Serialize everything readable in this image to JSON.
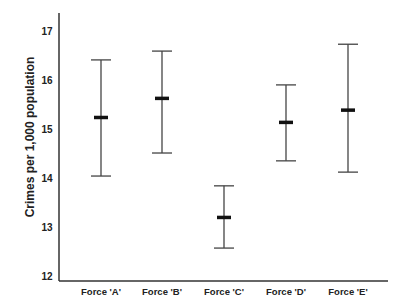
{
  "chart_data": {
    "type": "errorbar",
    "title": "",
    "xlabel": "",
    "ylabel": "Crimes per 1,000 population",
    "ylim": [
      12,
      17
    ],
    "yticks": [
      12,
      13,
      14,
      15,
      16,
      17
    ],
    "grid": false,
    "legend": null,
    "categories": [
      "Force 'A'",
      "Force 'B'",
      "Force 'C'",
      "Force 'D'",
      "Force 'E'"
    ],
    "series": [
      {
        "name": "mean",
        "values": [
          15.24,
          15.63,
          13.2,
          15.14,
          15.39
        ]
      },
      {
        "name": "upper",
        "values": [
          16.41,
          16.59,
          13.84,
          15.9,
          16.73
        ]
      },
      {
        "name": "lower",
        "values": [
          14.04,
          14.51,
          12.57,
          14.35,
          14.12
        ]
      }
    ]
  },
  "colors": {
    "axis": "#333333",
    "bar": "#444444",
    "mean_marker": "#111111"
  }
}
